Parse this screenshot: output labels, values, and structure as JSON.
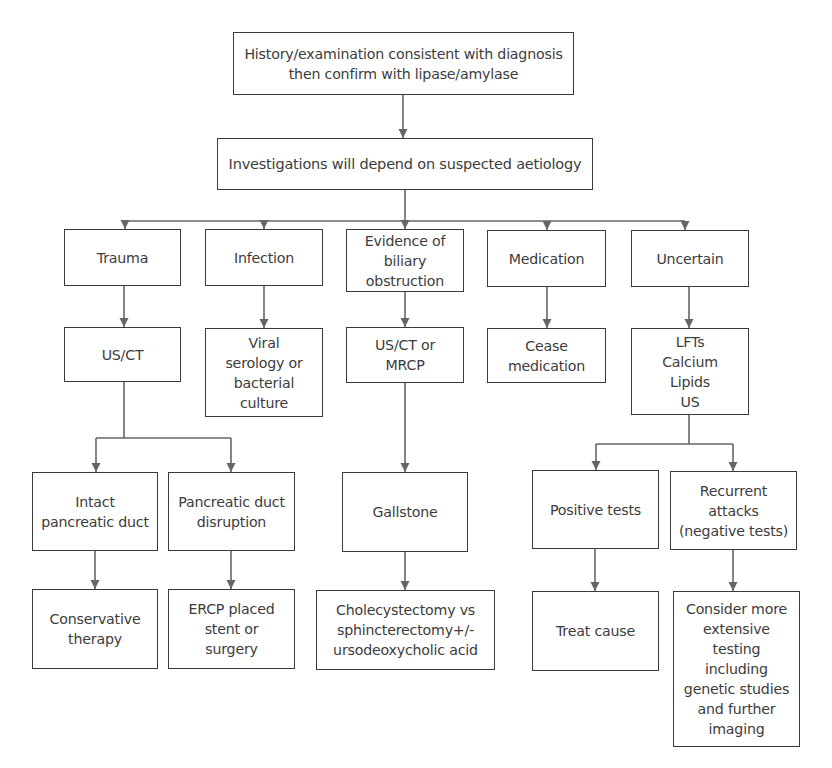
{
  "diagram": {
    "colors": {
      "box_border": "#3a3a3a",
      "connector": "#666666",
      "text": "#3c3c3c",
      "background": "#ffffff"
    },
    "nodes": {
      "history": {
        "label": "History/examination consistent with diagnosis\nthen confirm with lipase/amylase",
        "x": 233,
        "y": 32,
        "w": 341,
        "h": 63
      },
      "investigations": {
        "label": "Investigations will depend on suspected aetiology",
        "x": 217,
        "y": 138,
        "w": 376,
        "h": 52
      },
      "trauma": {
        "label": "Trauma",
        "x": 64,
        "y": 229,
        "w": 117,
        "h": 57
      },
      "infection": {
        "label": "Infection",
        "x": 205,
        "y": 229,
        "w": 118,
        "h": 57
      },
      "biliary": {
        "label": "Evidence of\nbiliary\nobstruction",
        "x": 346,
        "y": 229,
        "w": 118,
        "h": 63
      },
      "medication": {
        "label": "Medication",
        "x": 487,
        "y": 230,
        "w": 119,
        "h": 57
      },
      "uncertain": {
        "label": "Uncertain",
        "x": 631,
        "y": 230,
        "w": 118,
        "h": 57
      },
      "us_ct": {
        "label": "US/CT",
        "x": 64,
        "y": 327,
        "w": 117,
        "h": 55
      },
      "viral": {
        "label": "Viral\nserology or\nbacterial\nculture",
        "x": 205,
        "y": 328,
        "w": 118,
        "h": 89
      },
      "us_ct_mrcp": {
        "label": "US/CT or\nMRCP",
        "x": 346,
        "y": 327,
        "w": 118,
        "h": 56
      },
      "cease": {
        "label": "Cease\nmedication",
        "x": 487,
        "y": 328,
        "w": 119,
        "h": 55
      },
      "lfts": {
        "label": "LFTs\nCalcium\nLipids\nUS",
        "x": 631,
        "y": 328,
        "w": 118,
        "h": 87
      },
      "intact": {
        "label": "Intact\npancreatic duct",
        "x": 32,
        "y": 472,
        "w": 126,
        "h": 79
      },
      "disruption": {
        "label": "Pancreatic duct\ndisruption",
        "x": 168,
        "y": 472,
        "w": 127,
        "h": 79
      },
      "gallstone": {
        "label": "Gallstone",
        "x": 342,
        "y": 472,
        "w": 126,
        "h": 80
      },
      "positive": {
        "label": "Positive tests",
        "x": 532,
        "y": 470,
        "w": 127,
        "h": 79
      },
      "recurrent": {
        "label": "Recurrent\nattacks\n(negative tests)",
        "x": 670,
        "y": 471,
        "w": 127,
        "h": 79
      },
      "conservative": {
        "label": "Conservative\ntherapy",
        "x": 32,
        "y": 589,
        "w": 126,
        "h": 80
      },
      "ercp": {
        "label": "ERCP placed\nstent or\nsurgery",
        "x": 168,
        "y": 589,
        "w": 127,
        "h": 80
      },
      "cholecystectomy": {
        "label": "Cholecystectomy vs\nsphincterectomy+/-\nursodeoxycholic acid",
        "x": 316,
        "y": 590,
        "w": 179,
        "h": 80
      },
      "treat": {
        "label": "Treat cause",
        "x": 532,
        "y": 591,
        "w": 127,
        "h": 80
      },
      "consider": {
        "label": "Consider more\nextensive\ntesting\nincluding\ngenetic studies\nand further\nimaging",
        "x": 673,
        "y": 591,
        "w": 127,
        "h": 156
      }
    },
    "edges": [
      {
        "from": "history",
        "to": "investigations"
      },
      {
        "from": "investigations",
        "to": "trauma"
      },
      {
        "from": "investigations",
        "to": "infection"
      },
      {
        "from": "investigations",
        "to": "biliary"
      },
      {
        "from": "investigations",
        "to": "medication"
      },
      {
        "from": "investigations",
        "to": "uncertain"
      },
      {
        "from": "trauma",
        "to": "us_ct"
      },
      {
        "from": "infection",
        "to": "viral"
      },
      {
        "from": "biliary",
        "to": "us_ct_mrcp"
      },
      {
        "from": "medication",
        "to": "cease"
      },
      {
        "from": "uncertain",
        "to": "lfts"
      },
      {
        "from": "us_ct",
        "to": "intact"
      },
      {
        "from": "us_ct",
        "to": "disruption"
      },
      {
        "from": "us_ct_mrcp",
        "to": "gallstone"
      },
      {
        "from": "lfts",
        "to": "positive"
      },
      {
        "from": "lfts",
        "to": "recurrent"
      },
      {
        "from": "intact",
        "to": "conservative"
      },
      {
        "from": "disruption",
        "to": "ercp"
      },
      {
        "from": "gallstone",
        "to": "cholecystectomy"
      },
      {
        "from": "positive",
        "to": "treat"
      },
      {
        "from": "recurrent",
        "to": "consider"
      }
    ],
    "connector_paths": [
      {
        "id": "history-to-investigations",
        "points": [
          [
            403,
            95
          ],
          [
            403,
            138
          ]
        ]
      },
      {
        "id": "investigations-branch-trunk",
        "points": [
          [
            405,
            190
          ],
          [
            405,
            221
          ]
        ]
      },
      {
        "id": "investigations-branch-bar",
        "points": [
          [
            125,
            221
          ],
          [
            685,
            221
          ]
        ]
      },
      {
        "id": "to-trauma",
        "points": [
          [
            125,
            221
          ],
          [
            125,
            229
          ]
        ]
      },
      {
        "id": "to-infection",
        "points": [
          [
            264,
            221
          ],
          [
            264,
            229
          ]
        ]
      },
      {
        "id": "to-biliary",
        "points": [
          [
            405,
            221
          ],
          [
            405,
            229
          ]
        ]
      },
      {
        "id": "to-medication",
        "points": [
          [
            547,
            221
          ],
          [
            547,
            230
          ]
        ]
      },
      {
        "id": "to-uncertain",
        "points": [
          [
            685,
            221
          ],
          [
            685,
            230
          ]
        ]
      },
      {
        "id": "trauma-to-usct",
        "points": [
          [
            124,
            286
          ],
          [
            124,
            327
          ]
        ]
      },
      {
        "id": "infection-to-viral",
        "points": [
          [
            264,
            286
          ],
          [
            264,
            328
          ]
        ]
      },
      {
        "id": "biliary-to-mrcp",
        "points": [
          [
            405,
            292
          ],
          [
            405,
            327
          ]
        ]
      },
      {
        "id": "medication-to-cease",
        "points": [
          [
            547,
            287
          ],
          [
            547,
            328
          ]
        ]
      },
      {
        "id": "uncertain-to-lfts",
        "points": [
          [
            689,
            287
          ],
          [
            689,
            328
          ]
        ]
      },
      {
        "id": "usct-trunk",
        "points": [
          [
            124,
            382
          ],
          [
            124,
            438
          ]
        ]
      },
      {
        "id": "usct-bar",
        "points": [
          [
            96,
            438
          ],
          [
            231,
            438
          ]
        ]
      },
      {
        "id": "to-intact",
        "points": [
          [
            96,
            438
          ],
          [
            96,
            472
          ]
        ]
      },
      {
        "id": "to-disruption",
        "points": [
          [
            231,
            438
          ],
          [
            231,
            472
          ]
        ]
      },
      {
        "id": "mrcp-to-gallstone",
        "points": [
          [
            405,
            383
          ],
          [
            405,
            472
          ]
        ]
      },
      {
        "id": "lfts-trunk",
        "points": [
          [
            689,
            415
          ],
          [
            689,
            444
          ]
        ]
      },
      {
        "id": "lfts-bar",
        "points": [
          [
            596,
            444
          ],
          [
            733,
            444
          ]
        ]
      },
      {
        "id": "to-positive",
        "points": [
          [
            596,
            444
          ],
          [
            596,
            470
          ]
        ]
      },
      {
        "id": "to-recurrent",
        "points": [
          [
            733,
            444
          ],
          [
            733,
            471
          ]
        ]
      },
      {
        "id": "intact-to-conservative",
        "points": [
          [
            95,
            551
          ],
          [
            95,
            589
          ]
        ]
      },
      {
        "id": "disruption-to-ercp",
        "points": [
          [
            231,
            551
          ],
          [
            231,
            589
          ]
        ]
      },
      {
        "id": "gallstone-to-chole",
        "points": [
          [
            405,
            552
          ],
          [
            405,
            590
          ]
        ]
      },
      {
        "id": "positive-to-treat",
        "points": [
          [
            595,
            549
          ],
          [
            595,
            591
          ]
        ]
      },
      {
        "id": "recurrent-to-consider",
        "points": [
          [
            733,
            550
          ],
          [
            733,
            591
          ]
        ]
      }
    ],
    "arrowheads": [
      [
        403,
        138
      ],
      [
        125,
        229
      ],
      [
        264,
        229
      ],
      [
        405,
        229
      ],
      [
        547,
        230
      ],
      [
        685,
        230
      ],
      [
        124,
        327
      ],
      [
        264,
        328
      ],
      [
        405,
        327
      ],
      [
        547,
        328
      ],
      [
        689,
        328
      ],
      [
        96,
        472
      ],
      [
        231,
        472
      ],
      [
        405,
        472
      ],
      [
        596,
        470
      ],
      [
        733,
        471
      ],
      [
        95,
        589
      ],
      [
        231,
        589
      ],
      [
        405,
        590
      ],
      [
        595,
        591
      ],
      [
        733,
        591
      ]
    ]
  }
}
